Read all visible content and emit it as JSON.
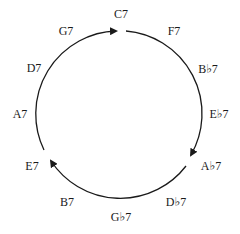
{
  "diagram": {
    "labels": [
      {
        "text": "C7",
        "x": 121,
        "y": 14
      },
      {
        "text": "F7",
        "x": 174,
        "y": 31
      },
      {
        "text": "B♭7",
        "x": 208,
        "y": 69
      },
      {
        "text": "E♭7",
        "x": 219,
        "y": 114
      },
      {
        "text": "A♭7",
        "x": 211,
        "y": 166
      },
      {
        "text": "D♭7",
        "x": 176,
        "y": 202
      },
      {
        "text": "G♭7",
        "x": 121,
        "y": 217
      },
      {
        "text": "B7",
        "x": 67,
        "y": 202
      },
      {
        "text": "E7",
        "x": 32,
        "y": 166
      },
      {
        "text": "A7",
        "x": 20,
        "y": 114
      },
      {
        "text": "D7",
        "x": 34,
        "y": 68
      },
      {
        "text": "G7",
        "x": 66,
        "y": 31
      }
    ],
    "arcs": [
      {
        "from": "E7-side",
        "to": "C7",
        "direction": "clockwise"
      },
      {
        "from": "C7",
        "to": "A♭7",
        "direction": "clockwise"
      },
      {
        "from": "A♭7",
        "to": "E7",
        "direction": "clockwise"
      }
    ],
    "stroke_color": "#1a1a1a"
  }
}
